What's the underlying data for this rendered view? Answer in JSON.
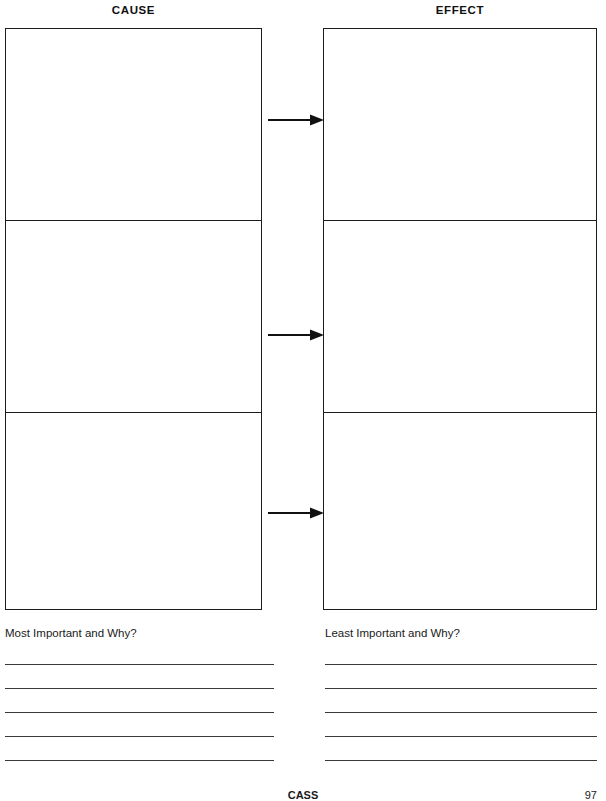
{
  "page": {
    "background_color": "#ffffff",
    "ink_color": "#1c1c1c"
  },
  "columns": {
    "cause": {
      "heading": "CAUSE",
      "cells": [
        {
          "value": ""
        },
        {
          "value": ""
        },
        {
          "value": ""
        }
      ]
    },
    "effect": {
      "heading": "EFFECT",
      "cells": [
        {
          "value": ""
        },
        {
          "value": ""
        },
        {
          "value": ""
        }
      ]
    }
  },
  "connectors": [
    {
      "icon": "arrow-right-icon",
      "direction": "right"
    },
    {
      "icon": "arrow-right-icon",
      "direction": "right"
    },
    {
      "icon": "arrow-right-icon",
      "direction": "right"
    }
  ],
  "prompts": {
    "left": "Most Important and Why?",
    "right": "Least Important and Why?"
  },
  "answer_lines": {
    "left_count": 5,
    "right_count": 5
  },
  "footer": {
    "center_label": "CASS",
    "page_number": "97"
  }
}
